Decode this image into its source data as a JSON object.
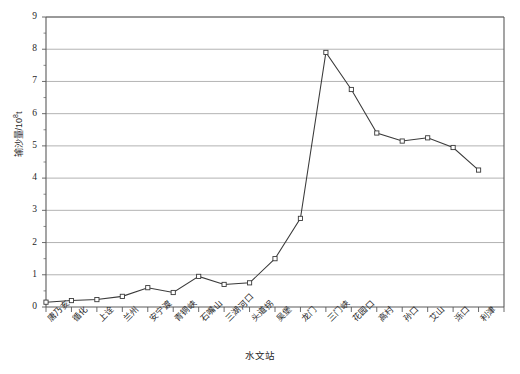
{
  "chart_data": {
    "type": "line",
    "title": "",
    "xlabel": "水文站",
    "ylabel": "输沙量/10⁸t",
    "ylabel_main": "输沙量/10",
    "ylabel_exp": "8",
    "ylabel_unit": "t",
    "ylim": [
      0,
      9
    ],
    "yticks": [
      0,
      1,
      2,
      3,
      4,
      5,
      6,
      7,
      8,
      9
    ],
    "ytick_labels": [
      "0",
      "1",
      "2",
      "3",
      "4",
      "5",
      "6",
      "7",
      "8",
      "9"
    ],
    "grid": true,
    "grid_axis": "y",
    "legend": false,
    "marker": "square-open",
    "line_color": "#3a3a3a",
    "marker_color": "#3a3a3a",
    "marker_fill": "#ffffff",
    "grid_color": "#9a9a9a",
    "axis_color": "#5a5a5a",
    "categories": [
      "唐乃亥",
      "循化",
      "上诠",
      "兰州",
      "安宁渡",
      "青铜峡",
      "石嘴山",
      "三湖河口",
      "头道拐",
      "吴堡",
      "龙门",
      "三门峡",
      "花园口",
      "高村",
      "孙口",
      "艾山",
      "泺口",
      "利津"
    ],
    "values": [
      0.15,
      0.2,
      0.23,
      0.33,
      0.6,
      0.45,
      0.95,
      0.7,
      0.75,
      1.5,
      2.75,
      7.9,
      6.75,
      5.4,
      5.15,
      5.25,
      4.95,
      4.25
    ]
  }
}
